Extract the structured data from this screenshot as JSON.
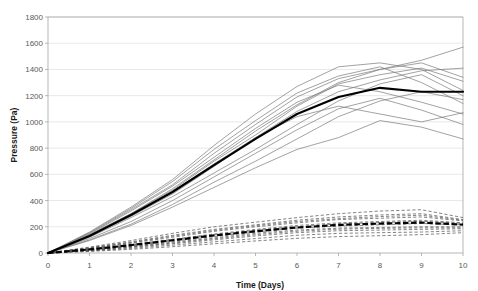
{
  "chart_data": {
    "type": "line",
    "title": "",
    "xlabel": "Time (Days)",
    "ylabel": "Pressure (Pa)",
    "xlim": [
      0,
      10
    ],
    "ylim": [
      0,
      1800
    ],
    "xticks": [
      0,
      1,
      2,
      3,
      4,
      5,
      6,
      7,
      8,
      9,
      10
    ],
    "yticks": [
      0,
      200,
      400,
      600,
      800,
      1000,
      1200,
      1400,
      1600,
      1800
    ],
    "grid": "horizontal",
    "legend": "none",
    "x": [
      0,
      1,
      2,
      3,
      4,
      5,
      6,
      7,
      8,
      9,
      10
    ],
    "groups": [
      {
        "name": "solid-group",
        "style": "solid",
        "color": "#7a7a7a",
        "series": [
          {
            "name": "solid-1",
            "values": [
              0,
              150,
              330,
              520,
              760,
              980,
              1190,
              1330,
              1400,
              1470,
              1570
            ]
          },
          {
            "name": "solid-2",
            "values": [
              0,
              140,
              300,
              480,
              700,
              900,
              1120,
              1290,
              1360,
              1410,
              1310
            ]
          },
          {
            "name": "solid-3",
            "values": [
              0,
              160,
              350,
              560,
              820,
              1060,
              1270,
              1420,
              1450,
              1400,
              1240
            ]
          },
          {
            "name": "solid-4",
            "values": [
              0,
              130,
              280,
              450,
              660,
              880,
              1080,
              1230,
              1320,
              1390,
              1410
            ]
          },
          {
            "name": "solid-5",
            "values": [
              0,
              120,
              270,
              430,
              610,
              790,
              980,
              1160,
              1290,
              1360,
              1200
            ]
          },
          {
            "name": "solid-6",
            "values": [
              0,
              145,
              320,
              510,
              730,
              950,
              1150,
              1280,
              1230,
              1150,
              1060
            ]
          },
          {
            "name": "solid-7",
            "values": [
              0,
              110,
              240,
              400,
              580,
              760,
              940,
              1100,
              1180,
              1090,
              980
            ]
          },
          {
            "name": "solid-8",
            "values": [
              0,
              155,
              340,
              545,
              790,
              1010,
              1220,
              1350,
              1420,
              1300,
              1140
            ]
          },
          {
            "name": "solid-9",
            "values": [
              0,
              100,
              220,
              370,
              540,
              700,
              870,
              1040,
              1160,
              1230,
              1170
            ]
          },
          {
            "name": "solid-10",
            "values": [
              0,
              125,
              290,
              470,
              680,
              880,
              1040,
              1120,
              1060,
              1000,
              1070
            ]
          },
          {
            "name": "solid-11",
            "values": [
              0,
              95,
              210,
              350,
              500,
              650,
              790,
              880,
              1010,
              960,
              870
            ]
          },
          {
            "name": "solid-12",
            "values": [
              0,
              135,
              300,
              490,
              710,
              930,
              1130,
              1300,
              1400,
              1450,
              1340
            ]
          }
        ],
        "mean": {
          "name": "solid-mean",
          "values": [
            0,
            130,
            290,
            465,
            670,
            870,
            1060,
            1190,
            1260,
            1230,
            1230
          ]
        }
      },
      {
        "name": "dashed-group",
        "style": "dashed",
        "color": "#4d4d4d",
        "series": [
          {
            "name": "dashed-1",
            "values": [
              0,
              45,
              95,
              150,
              200,
              235,
              270,
              300,
              320,
              330,
              270
            ]
          },
          {
            "name": "dashed-2",
            "values": [
              0,
              40,
              85,
              135,
              180,
              215,
              250,
              275,
              290,
              300,
              255
            ]
          },
          {
            "name": "dashed-3",
            "values": [
              0,
              35,
              75,
              120,
              165,
              200,
              230,
              255,
              265,
              275,
              245
            ]
          },
          {
            "name": "dashed-4",
            "values": [
              0,
              30,
              65,
              105,
              145,
              180,
              210,
              230,
              240,
              250,
              230
            ]
          },
          {
            "name": "dashed-5",
            "values": [
              0,
              25,
              55,
              90,
              125,
              160,
              190,
              205,
              215,
              225,
              215
            ]
          },
          {
            "name": "dashed-6",
            "values": [
              0,
              22,
              50,
              82,
              115,
              150,
              175,
              190,
              195,
              200,
              200
            ]
          },
          {
            "name": "dashed-7",
            "values": [
              0,
              18,
              42,
              70,
              100,
              130,
              155,
              170,
              175,
              180,
              185
            ]
          },
          {
            "name": "dashed-8",
            "values": [
              0,
              15,
              35,
              60,
              85,
              110,
              135,
              150,
              155,
              160,
              170
            ]
          },
          {
            "name": "dashed-9",
            "values": [
              0,
              12,
              28,
              48,
              70,
              92,
              112,
              125,
              132,
              140,
              155
            ]
          },
          {
            "name": "dashed-10",
            "values": [
              0,
              38,
              80,
              128,
              172,
              208,
              240,
              262,
              278,
              288,
              250
            ]
          },
          {
            "name": "dashed-11",
            "values": [
              0,
              28,
              60,
              98,
              138,
              172,
              200,
              222,
              232,
              242,
              225
            ]
          },
          {
            "name": "dashed-12",
            "values": [
              0,
              20,
              46,
              76,
              108,
              140,
              166,
              182,
              188,
              192,
              192
            ]
          }
        ],
        "mean": {
          "name": "dashed-mean",
          "values": [
            0,
            27,
            60,
            97,
            134,
            166,
            194,
            214,
            224,
            232,
            216
          ]
        }
      }
    ]
  },
  "axes": {
    "y_label": "Pressure (Pa)",
    "x_label": "Time (Days)",
    "y_tick_labels": [
      "0",
      "200",
      "400",
      "600",
      "800",
      "1000",
      "1200",
      "1400",
      "1600",
      "1800"
    ],
    "x_tick_labels": [
      "0",
      "1",
      "2",
      "3",
      "4",
      "5",
      "6",
      "7",
      "8",
      "9",
      "10"
    ]
  },
  "colors": {
    "background": "#ffffff",
    "gridline": "#d9d9d9",
    "plot_border": "#a6a6a6",
    "solid_series": "#7a7a7a",
    "dashed_series": "#4d4d4d",
    "mean_line": "#000000",
    "tick_text": "#595959",
    "axis_title_text": "#1a1a1a"
  }
}
